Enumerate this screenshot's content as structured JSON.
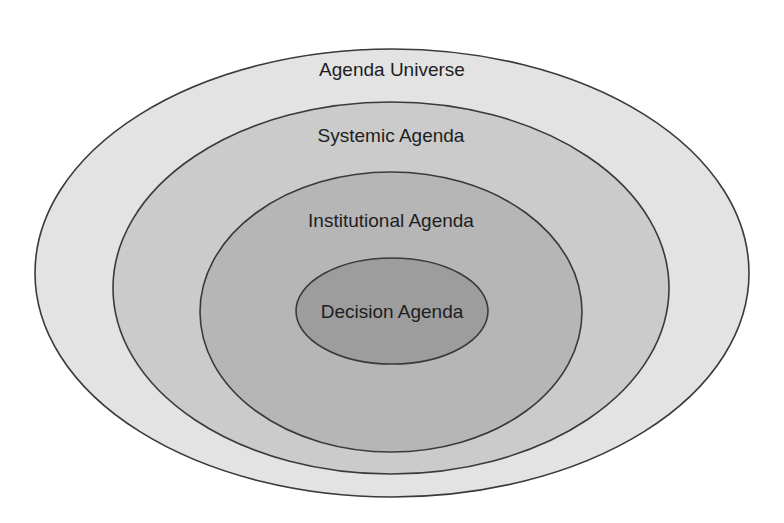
{
  "diagram": {
    "layers": [
      {
        "label": "Agenda Universe",
        "fill": "#e3e3e3",
        "cx": 392,
        "cy": 273,
        "rx": 357,
        "ry": 224,
        "label_y": 76
      },
      {
        "label": "Systemic Agenda",
        "fill": "#cbcbcb",
        "cx": 391,
        "cy": 288,
        "rx": 278,
        "ry": 186,
        "label_y": 142
      },
      {
        "label": "Institutional Agenda",
        "fill": "#b6b6b6",
        "cx": 391,
        "cy": 312,
        "rx": 191,
        "ry": 140,
        "label_y": 227
      },
      {
        "label": "Decision Agenda",
        "fill": "#9d9d9d",
        "cx": 392,
        "cy": 311,
        "rx": 96,
        "ry": 53,
        "label_y": 318
      }
    ],
    "stroke_color": "#3a3a3a"
  }
}
